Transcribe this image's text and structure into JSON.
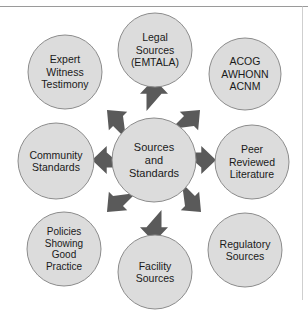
{
  "diagram": {
    "title_visible": false,
    "type": "radial-hub-and-spoke",
    "colors": {
      "node_fill": "#dcdcdc",
      "node_stroke": "#8c8c8c",
      "arrow_fill": "#5a5a5a",
      "text": "#1a1a1a",
      "background": "#ffffff",
      "frame_line": "#9a9a9a"
    },
    "center": {
      "id": "sources-and-standards",
      "lines": [
        "Sources",
        "and",
        "Standards"
      ],
      "cx": 154,
      "cy": 160,
      "r": 42
    },
    "nodes": [
      {
        "id": "legal-sources",
        "lines": [
          "Legal",
          "Sources",
          "(EMTALA)"
        ],
        "cx": 155,
        "cy": 50,
        "r": 37,
        "direction": "up",
        "arrow": {
          "x": 154,
          "y": 95,
          "angle": 270
        }
      },
      {
        "id": "acog-awhonn-acnm",
        "lines": [
          "ACOG",
          "AWHONN",
          "ACNM"
        ],
        "cx": 245,
        "cy": 74,
        "r": 36,
        "direction": "up-right",
        "arrow": {
          "x": 188,
          "y": 122,
          "angle": 315
        }
      },
      {
        "id": "peer-reviewed-literature",
        "lines": [
          "Peer",
          "Reviewed",
          "Literature"
        ],
        "cx": 252,
        "cy": 162,
        "r": 37,
        "direction": "right",
        "arrow": {
          "x": 200,
          "y": 160,
          "angle": 0
        }
      },
      {
        "id": "regulatory-sources",
        "lines": [
          "Regulatory",
          "Sources"
        ],
        "cx": 245,
        "cy": 250,
        "r": 37,
        "direction": "down-right",
        "arrow": {
          "x": 189,
          "y": 200,
          "angle": 45
        }
      },
      {
        "id": "facility-sources",
        "lines": [
          "Facility",
          "Sources"
        ],
        "cx": 155,
        "cy": 272,
        "r": 37,
        "direction": "down",
        "arrow": {
          "x": 154,
          "y": 226,
          "angle": 90
        }
      },
      {
        "id": "policies-showing-good-practice",
        "lines": [
          "Policies",
          "Showing",
          "Good",
          "Practice"
        ],
        "cx": 64,
        "cy": 249,
        "r": 37,
        "direction": "down-left",
        "arrow": {
          "x": 119,
          "y": 200,
          "angle": 135
        }
      },
      {
        "id": "community-standards",
        "lines": [
          "Community",
          "Standards"
        ],
        "cx": 56,
        "cy": 161,
        "r": 38,
        "direction": "left",
        "arrow": {
          "x": 108,
          "y": 160,
          "angle": 180
        }
      },
      {
        "id": "expert-witness-testimony",
        "lines": [
          "Expert",
          "Witness",
          "Testimony"
        ],
        "cx": 65,
        "cy": 72,
        "r": 37,
        "direction": "up-left",
        "arrow": {
          "x": 119,
          "y": 122,
          "angle": 225
        }
      }
    ]
  }
}
